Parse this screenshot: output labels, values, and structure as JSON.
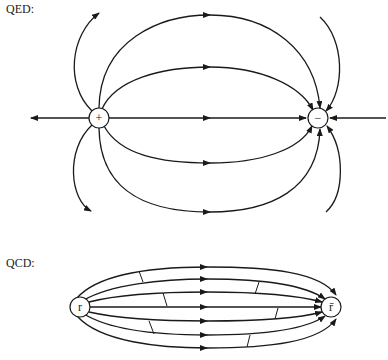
{
  "diagrams": {
    "qed": {
      "label": "QED:",
      "positive_charge": {
        "symbol": "+"
      },
      "negative_charge": {
        "symbol": "−"
      }
    },
    "qcd": {
      "label": "QCD:",
      "quark": {
        "symbol": "r"
      },
      "antiquark": {
        "symbol": "r̄"
      }
    }
  }
}
